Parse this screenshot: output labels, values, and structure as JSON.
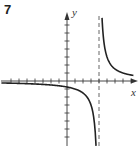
{
  "problem_number": "7",
  "chart_data": {
    "type": "line",
    "title": "",
    "xlabel": "x",
    "ylabel": "y",
    "function": "y = 3/(x - 4)",
    "vertical_asymptote": 4,
    "horizontal_asymptote": 0,
    "xlim": [
      -8.2,
      8.8
    ],
    "ylim": [
      -8.1,
      9
    ],
    "grid": false,
    "ticks": {
      "x_spacing": 1,
      "y_spacing": 1,
      "x_range": [
        -7,
        8
      ],
      "y_range": [
        -7,
        7
      ]
    },
    "series": [
      {
        "name": "left-branch",
        "x": [
          -8,
          -6,
          -4,
          -2,
          0,
          1,
          2,
          3,
          3.5,
          3.63
        ],
        "y": [
          -0.25,
          -0.3,
          -0.375,
          -0.5,
          -0.75,
          -1,
          -1.5,
          -3,
          -6,
          -8.1
        ]
      },
      {
        "name": "right-branch",
        "x": [
          4.38,
          4.5,
          5,
          6,
          7,
          8
        ],
        "y": [
          7.9,
          6,
          3,
          1.5,
          1,
          0.75
        ]
      }
    ],
    "colors": {
      "curve": "#222222",
      "axes": "#333333",
      "asymptote": "#555555"
    }
  }
}
